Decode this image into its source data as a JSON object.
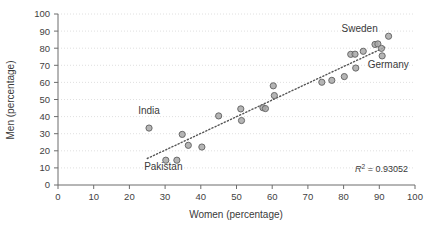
{
  "chart_data": {
    "type": "scatter",
    "title": "",
    "xlabel": "Women (percentage)",
    "ylabel": "Men (percentage)",
    "xlim": [
      0,
      100
    ],
    "ylim": [
      0,
      100
    ],
    "xticks": [
      "0",
      "10",
      "20",
      "30",
      "40",
      "50",
      "60",
      "70",
      "80",
      "90",
      "100"
    ],
    "yticks": [
      "0",
      "10",
      "20",
      "30",
      "40",
      "50",
      "60",
      "70",
      "80",
      "90",
      "100"
    ],
    "grid": "horizontal-dotted",
    "legend": "none",
    "marker_color": "#a8a8a8",
    "marker_edge_color": "#6a6a6a",
    "trendline_color": "#555555",
    "points": [
      {
        "x": 25.5,
        "y": 33.3
      },
      {
        "x": 30.2,
        "y": 14.5
      },
      {
        "x": 33.3,
        "y": 14.5
      },
      {
        "x": 34.8,
        "y": 29.6
      },
      {
        "x": 36.5,
        "y": 23.2
      },
      {
        "x": 40.3,
        "y": 22.2
      },
      {
        "x": 45.0,
        "y": 40.4
      },
      {
        "x": 51.2,
        "y": 44.5
      },
      {
        "x": 51.4,
        "y": 37.7
      },
      {
        "x": 57.4,
        "y": 45.2
      },
      {
        "x": 58.1,
        "y": 44.7
      },
      {
        "x": 60.3,
        "y": 58.0
      },
      {
        "x": 60.6,
        "y": 52.3
      },
      {
        "x": 73.9,
        "y": 60.1
      },
      {
        "x": 76.7,
        "y": 61.2
      },
      {
        "x": 80.2,
        "y": 63.4
      },
      {
        "x": 82.0,
        "y": 76.4
      },
      {
        "x": 83.2,
        "y": 76.5
      },
      {
        "x": 83.4,
        "y": 68.4
      },
      {
        "x": 85.5,
        "y": 78.2
      },
      {
        "x": 88.8,
        "y": 82.2
      },
      {
        "x": 89.6,
        "y": 82.5
      },
      {
        "x": 90.6,
        "y": 79.9
      },
      {
        "x": 90.8,
        "y": 75.5
      },
      {
        "x": 92.6,
        "y": 87.0
      }
    ],
    "annotations": [
      {
        "text": "India",
        "x": 25.5,
        "y": 41.5,
        "anchor": "middle"
      },
      {
        "text": "Pakistan",
        "x": 29.5,
        "y": 9.0,
        "anchor": "middle"
      },
      {
        "text": "Sweden",
        "x": 84.5,
        "y": 89.5,
        "anchor": "middle"
      },
      {
        "text": "Germany",
        "x": 92.5,
        "y": 68.5,
        "anchor": "middle"
      }
    ],
    "trendline": {
      "x0": 25.0,
      "y0": 15.5,
      "x1": 91.5,
      "y1": 80.5
    },
    "r2_prefix": "R",
    "r2_superscript": "2",
    "r2_value": " = 0.93052"
  }
}
